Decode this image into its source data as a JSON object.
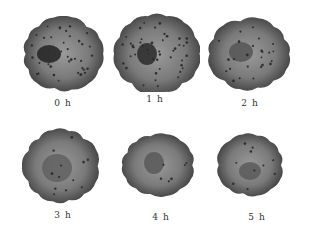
{
  "figure": {
    "panels": [
      {
        "label": "0 h",
        "x": 18,
        "y": 16,
        "cx": 45,
        "cy": 38,
        "rx": 40,
        "ry": 37,
        "nucleus": {
          "dx": -14,
          "dy": 0,
          "rx": 12,
          "ry": 9,
          "color": "#222222"
        },
        "dots": 40
      },
      {
        "label": "1 h",
        "x": 110,
        "y": 12,
        "cx": 47,
        "cy": 42,
        "rx": 43,
        "ry": 40,
        "nucleus": {
          "dx": -10,
          "dy": 0,
          "rx": 10,
          "ry": 11,
          "color": "#2a2a2a"
        },
        "dots": 45
      },
      {
        "label": "2 h",
        "x": 205,
        "y": 16,
        "cx": 44,
        "cy": 38,
        "rx": 41,
        "ry": 36,
        "nucleus": {
          "dx": -8,
          "dy": -2,
          "rx": 12,
          "ry": 10,
          "color": "#555555"
        },
        "dots": 25
      },
      {
        "label": "3 h",
        "x": 18,
        "y": 128,
        "cx": 43,
        "cy": 38,
        "rx": 38,
        "ry": 37,
        "nucleus": {
          "dx": -4,
          "dy": 2,
          "rx": 15,
          "ry": 14,
          "color": "#606060"
        },
        "dots": 12
      },
      {
        "label": "4 h",
        "x": 116,
        "y": 130,
        "cx": 42,
        "cy": 35,
        "rx": 36,
        "ry": 31,
        "nucleus": {
          "dx": -4,
          "dy": -2,
          "rx": 10,
          "ry": 11,
          "color": "#585858"
        },
        "dots": 6
      },
      {
        "label": "5 h",
        "x": 212,
        "y": 130,
        "cx": 38,
        "cy": 35,
        "rx": 33,
        "ry": 31,
        "nucleus": {
          "dx": 0,
          "dy": 6,
          "rx": 11,
          "ry": 9,
          "color": "#5a5a5a"
        },
        "dots": 10
      }
    ],
    "colors": {
      "cell_edge": "#4a4a4a",
      "cell_mid": "#7a7a7a",
      "cell_light": "#9a9a9a",
      "dot": "#2e2e2e"
    }
  }
}
